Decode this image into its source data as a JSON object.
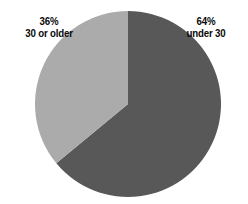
{
  "chart_data": {
    "type": "pie",
    "title": "",
    "subtitle": "",
    "xlabel": "",
    "ylabel": "",
    "grid": false,
    "legend_position": "labels-outside",
    "categories": [
      "under 30",
      "30 or older"
    ],
    "values": [
      64,
      36
    ],
    "units": "percent",
    "slices": [
      {
        "label": "under 30",
        "percent_text": "64%",
        "value": 64,
        "color": "#585858",
        "start_angle_deg": 0,
        "end_angle_deg": 230.4,
        "label_side": "right"
      },
      {
        "label": "30 or older",
        "percent_text": "36%",
        "value": 36,
        "color": "#ababab",
        "start_angle_deg": 230.4,
        "end_angle_deg": 360,
        "label_side": "left"
      }
    ],
    "background_color": "#ffffff",
    "label_color": "#0a0a0a"
  },
  "labels": {
    "left": {
      "percent": "36%",
      "category": "30 or older"
    },
    "right": {
      "percent": "64%",
      "category": "under 30"
    }
  }
}
